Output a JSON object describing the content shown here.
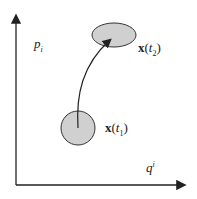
{
  "diagram": {
    "axes": {
      "vertical_label": {
        "base": "p",
        "sub": "i"
      },
      "horizontal_label": {
        "base": "q",
        "sup": "i"
      }
    },
    "regions": [
      {
        "id": "region-t1",
        "label_vec": "x",
        "label_arg": "t",
        "label_sub": "1",
        "shape": "circle"
      },
      {
        "id": "region-t2",
        "label_vec": "x",
        "label_arg": "t",
        "label_sub": "2",
        "shape": "ellipse"
      }
    ],
    "colors": {
      "fill": "#d0d0d0",
      "stroke": "#333333",
      "axis": "#222222"
    }
  }
}
